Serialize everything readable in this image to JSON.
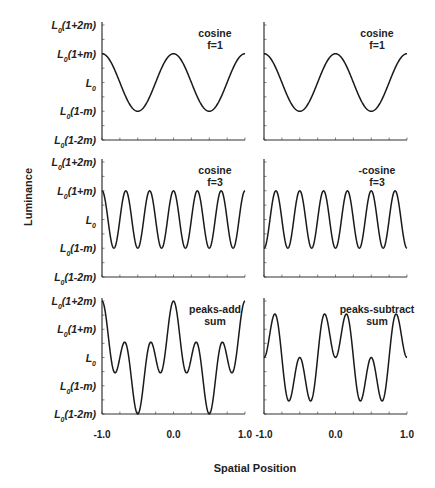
{
  "chart_data": {
    "type": "line",
    "layout": "3x2 grid of panels",
    "xlabel": "Spatial Position",
    "ylabel": "Luminance",
    "x_ticks": [
      "-1.0",
      "0.0",
      "1.0"
    ],
    "xlim": [
      -1.0,
      1.0
    ],
    "y_ticks": [
      "L0(1+2m)",
      "L0(1+m)",
      "L0",
      "L0(1-m)",
      "L0(1-2m)"
    ],
    "ylim": [
      -2,
      2
    ],
    "grid": false,
    "panels": [
      {
        "row": 0,
        "col": 0,
        "annotation": [
          "cosine",
          "f=1"
        ],
        "formula": "cos(2*pi*1*x)",
        "amplitude": 1
      },
      {
        "row": 0,
        "col": 1,
        "annotation": [
          "cosine",
          "f=1"
        ],
        "formula": "cos(2*pi*1*x)",
        "amplitude": 1
      },
      {
        "row": 1,
        "col": 0,
        "annotation": [
          "cosine",
          "f=3"
        ],
        "formula": "cos(2*pi*3*x)",
        "amplitude": 1
      },
      {
        "row": 1,
        "col": 1,
        "annotation": [
          "-cosine",
          "f=3"
        ],
        "formula": "-cos(2*pi*3*x)",
        "amplitude": 1
      },
      {
        "row": 2,
        "col": 0,
        "annotation": [
          "peaks-add",
          "sum"
        ],
        "formula": "cos(2*pi*1*x)+cos(2*pi*3*x)",
        "amplitude": 2
      },
      {
        "row": 2,
        "col": 1,
        "annotation": [
          "peaks-subtract",
          "sum"
        ],
        "formula": "cos(2*pi*1*x)-cos(2*pi*3*x)",
        "amplitude": 2
      }
    ]
  },
  "labels": {
    "ylabel": "Luminance",
    "xlabel": "Spatial Position",
    "x_ticks": [
      "-1.0",
      "0.0",
      "1.0"
    ],
    "y_ticks": [
      {
        "main": "L",
        "sub": "0",
        "rest": "(1+2m)"
      },
      {
        "main": "L",
        "sub": "0",
        "rest": "(1+m)"
      },
      {
        "main": "L",
        "sub": "0",
        "rest": ""
      },
      {
        "main": "L",
        "sub": "0",
        "rest": "(1-m)"
      },
      {
        "main": "L",
        "sub": "0",
        "rest": "(1-2m)"
      }
    ],
    "panels": [
      {
        "line1": "cosine",
        "line2": "f=1"
      },
      {
        "line1": "cosine",
        "line2": "f=1"
      },
      {
        "line1": "cosine",
        "line2": "f=3"
      },
      {
        "line1": "-cosine",
        "line2": "f=3"
      },
      {
        "line1": "peaks-add",
        "line2": "sum"
      },
      {
        "line1": "peaks-subtract",
        "line2": "sum"
      }
    ]
  },
  "colors": {
    "line": "#1a1a1a",
    "axis": "#333333",
    "text": "#222222"
  }
}
